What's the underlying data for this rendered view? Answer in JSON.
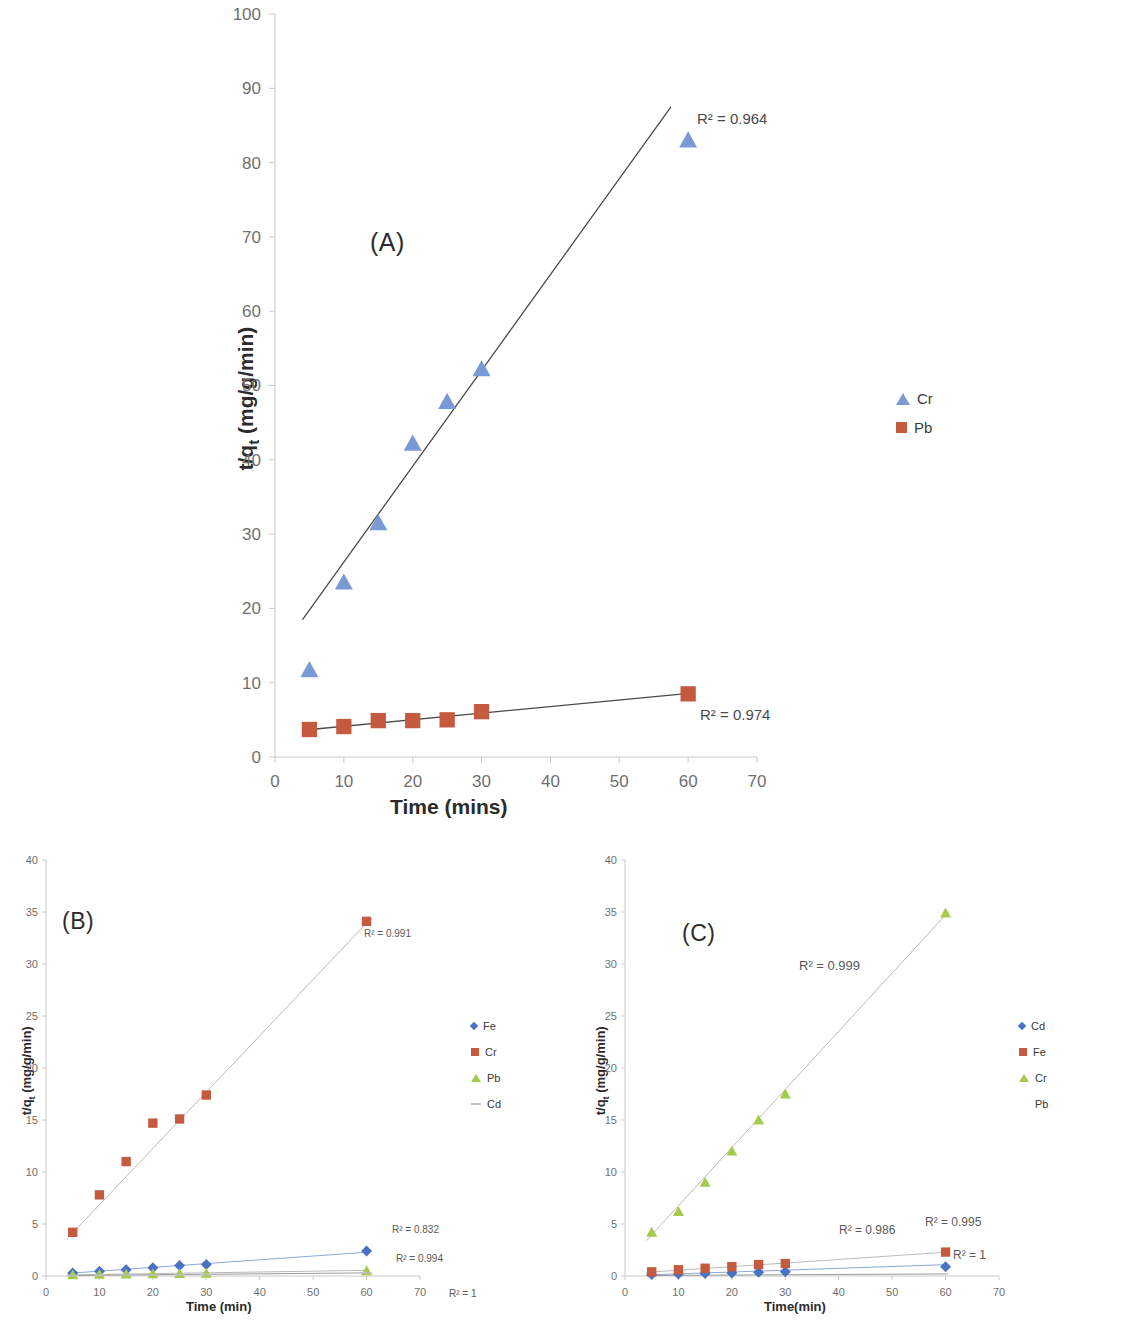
{
  "figure": {
    "panels": [
      "(A)",
      "(B)",
      "(C)"
    ]
  },
  "colors": {
    "cr_blue": "#7a9ad6",
    "pb_red": "#c55a3f",
    "green": "#a8c94f",
    "blue_diamond": "#4a72c4",
    "trend_dark": "#4a4a4a",
    "trend_faint": "#b9b9b9",
    "axis": "#c9c9c9",
    "text": "#3a3a3a"
  },
  "panelA": {
    "label": "(A)",
    "xlabel": "Time (mins)",
    "ylabel": "t/qt (mg/g/min)",
    "ylabel_parts": {
      "lead": "t/q",
      "sub": "t",
      "tail": " (mg/g/min)"
    },
    "xticks": [
      "0",
      "10",
      "20",
      "30",
      "40",
      "50",
      "60",
      "70"
    ],
    "yticks": [
      "0",
      "10",
      "20",
      "30",
      "40",
      "50",
      "60",
      "70",
      "80",
      "90",
      "100"
    ],
    "legend": [
      {
        "label": "Cr",
        "marker": "triangle",
        "color": "#7a9ad6"
      },
      {
        "label": "Pb",
        "marker": "square",
        "color": "#c55a3f"
      }
    ],
    "annotations": [
      {
        "text": "R² = 0.964",
        "series": "Cr"
      },
      {
        "text": "R² = 0.974",
        "series": "Pb"
      }
    ]
  },
  "panelB": {
    "label": "(B)",
    "xlabel": "Time (min)",
    "ylabel": "t/qt (mg/g/min)",
    "ylabel_parts": {
      "lead": "t/q",
      "sub": "t",
      "tail": " (mg/g/min)"
    },
    "xticks": [
      "0",
      "10",
      "20",
      "30",
      "40",
      "50",
      "60",
      "70"
    ],
    "yticks": [
      "0",
      "5",
      "10",
      "15",
      "20",
      "25",
      "30",
      "35",
      "40"
    ],
    "legend": [
      {
        "label": "Fe",
        "marker": "diamond",
        "color": "#4a72c4"
      },
      {
        "label": "Cr",
        "marker": "square",
        "color": "#c55a3f"
      },
      {
        "label": "Pb",
        "marker": "triangle",
        "color": "#a8c94f"
      },
      {
        "label": "Cd",
        "marker": "dash",
        "color": "#c0c0c0"
      }
    ],
    "annotations": [
      {
        "text": "R² = 0.991",
        "series": "Cr"
      },
      {
        "text": "R² = 0.832",
        "series": "Pb"
      },
      {
        "text": "R² = 0.994",
        "series": "Fe"
      },
      {
        "text": "R² = 1",
        "series": "Cd"
      }
    ]
  },
  "panelC": {
    "label": "(C)",
    "xlabel": "Time(min)",
    "ylabel": "t/qt (mg/g/min)",
    "ylabel_parts": {
      "lead": "t/q",
      "sub": "t",
      "tail": " (mg/g/min)"
    },
    "xticks": [
      "0",
      "10",
      "20",
      "30",
      "40",
      "50",
      "60",
      "70"
    ],
    "yticks": [
      "0",
      "5",
      "10",
      "15",
      "20",
      "25",
      "30",
      "35",
      "40"
    ],
    "legend": [
      {
        "label": "Cd",
        "marker": "diamond",
        "color": "#4a72c4"
      },
      {
        "label": "Fe",
        "marker": "square",
        "color": "#c55a3f"
      },
      {
        "label": "Cr",
        "marker": "triangle",
        "color": "#a8c94f"
      },
      {
        "label": "Pb",
        "marker": "none",
        "color": "#c0c0c0"
      }
    ],
    "annotations": [
      {
        "text": "R² = 0.999",
        "series": "Cr"
      },
      {
        "text": "R² = 0.986",
        "series": "Fe"
      },
      {
        "text": "R² = 0.995",
        "series": "Cd"
      },
      {
        "text": "R² = 1",
        "series": "Pb"
      }
    ]
  },
  "chart_data": [
    {
      "type": "scatter",
      "panel": "(A)",
      "title": "",
      "xlabel": "Time (mins)",
      "ylabel": "t/qt (mg/g/min)",
      "xlim": [
        0,
        70
      ],
      "ylim": [
        0,
        100
      ],
      "xticks": [
        0,
        10,
        20,
        30,
        40,
        50,
        60,
        70
      ],
      "yticks": [
        0,
        10,
        20,
        30,
        40,
        50,
        60,
        70,
        80,
        90,
        100
      ],
      "grid": false,
      "legend_position": "right",
      "x": [
        5,
        10,
        15,
        20,
        25,
        30,
        60
      ],
      "series": [
        {
          "name": "Cr",
          "marker": "triangle",
          "color": "#7a9ad6",
          "values": [
            11.7,
            23.5,
            31.5,
            42.2,
            47.8,
            52.2,
            83.0
          ],
          "trendline": {
            "r2": "R² = 0.964",
            "x0": 4,
            "y0": 18.5,
            "x1": 57.5,
            "y1": 87.5
          }
        },
        {
          "name": "Pb",
          "marker": "square",
          "color": "#c55a3f",
          "values": [
            3.7,
            4.1,
            4.9,
            4.9,
            5.0,
            6.1,
            8.5
          ],
          "trendline": {
            "r2": "R² = 0.974",
            "x0": 4,
            "y0": 3.6,
            "x1": 60.5,
            "y1": 8.6
          }
        }
      ]
    },
    {
      "type": "scatter",
      "panel": "(B)",
      "title": "",
      "xlabel": "Time (min)",
      "ylabel": "t/qt (mg/g/min)",
      "xlim": [
        0,
        70
      ],
      "ylim": [
        0,
        40
      ],
      "xticks": [
        0,
        10,
        20,
        30,
        40,
        50,
        60,
        70
      ],
      "yticks": [
        0,
        5,
        10,
        15,
        20,
        25,
        30,
        35,
        40
      ],
      "grid": false,
      "legend_position": "right",
      "x": [
        5,
        10,
        15,
        20,
        25,
        30,
        60
      ],
      "series": [
        {
          "name": "Fe",
          "marker": "diamond",
          "color": "#4a72c4",
          "values": [
            0.3,
            0.45,
            0.6,
            0.8,
            1.0,
            1.1,
            2.4
          ],
          "trendline": {
            "r2": "R² = 0.994",
            "x0": 4,
            "y0": 0.25,
            "x1": 60.5,
            "y1": 2.3
          }
        },
        {
          "name": "Cr",
          "marker": "square",
          "color": "#c55a3f",
          "values": [
            4.2,
            7.8,
            11.0,
            14.7,
            15.1,
            17.4,
            34.1
          ],
          "trendline": {
            "r2": "R² = 0.991",
            "x0": 4,
            "y0": 3.6,
            "x1": 60.5,
            "y1": 34.2
          }
        },
        {
          "name": "Pb",
          "marker": "triangle",
          "color": "#a8c94f",
          "values": [
            0.1,
            0.15,
            0.18,
            0.2,
            0.22,
            0.25,
            0.5
          ],
          "trendline": {
            "r2": "R² = 0.832",
            "x0": 4,
            "y0": 0.1,
            "x1": 60.5,
            "y1": 0.55
          }
        },
        {
          "name": "Cd",
          "marker": "dash",
          "color": "#c0c0c0",
          "values": [
            0.05,
            0.07,
            0.09,
            0.1,
            0.12,
            0.14,
            0.3
          ],
          "trendline": {
            "r2": "R² = 1",
            "x0": 4,
            "y0": 0.05,
            "x1": 60.5,
            "y1": 0.3
          }
        }
      ]
    },
    {
      "type": "scatter",
      "panel": "(C)",
      "title": "",
      "xlabel": "Time(min)",
      "ylabel": "t/qt (mg/g/min)",
      "xlim": [
        0,
        70
      ],
      "ylim": [
        0,
        40
      ],
      "xticks": [
        0,
        10,
        20,
        30,
        40,
        50,
        60,
        70
      ],
      "yticks": [
        0,
        5,
        10,
        15,
        20,
        25,
        30,
        35,
        40
      ],
      "grid": false,
      "legend_position": "right",
      "x": [
        5,
        10,
        15,
        20,
        25,
        30,
        60
      ],
      "series": [
        {
          "name": "Cd",
          "marker": "diamond",
          "color": "#4a72c4",
          "values": [
            0.15,
            0.2,
            0.25,
            0.3,
            0.35,
            0.4,
            0.9
          ],
          "trendline": {
            "r2": "R² = 0.995",
            "x0": 4,
            "y0": 0.1,
            "x1": 60.5,
            "y1": 1.1
          }
        },
        {
          "name": "Fe",
          "marker": "square",
          "color": "#c55a3f",
          "values": [
            0.4,
            0.6,
            0.75,
            0.9,
            1.1,
            1.2,
            2.3
          ],
          "trendline": {
            "r2": "R² = 0.986",
            "x0": 4,
            "y0": 0.35,
            "x1": 60.5,
            "y1": 2.3
          }
        },
        {
          "name": "Cr",
          "marker": "triangle",
          "color": "#a8c94f",
          "values": [
            4.2,
            6.2,
            9.0,
            12.0,
            15.0,
            17.5,
            34.9
          ],
          "trendline": {
            "r2": "R² = 0.999",
            "x0": 4,
            "y0": 3.4,
            "x1": 60.5,
            "y1": 35.0
          }
        },
        {
          "name": "Pb",
          "marker": "none",
          "color": "#c0c0c0",
          "values": [
            0.05,
            0.06,
            0.07,
            0.08,
            0.09,
            0.1,
            0.15
          ],
          "trendline": {
            "r2": "R² = 1",
            "x0": 4,
            "y0": 0.05,
            "x1": 60.5,
            "y1": 0.2
          }
        }
      ]
    }
  ]
}
